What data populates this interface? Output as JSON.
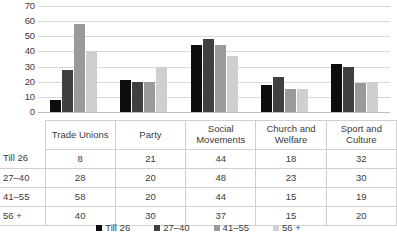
{
  "chart_data": {
    "type": "bar",
    "title": "",
    "xlabel": "",
    "ylabel": "",
    "ylim": [
      0,
      70
    ],
    "ytick_step": 10,
    "yticks": [
      70,
      60,
      50,
      40,
      30,
      20,
      10,
      0
    ],
    "grid": true,
    "legend_position": "bottom",
    "categories": [
      "Trade Unions",
      "Party",
      "Social Movements",
      "Church and Welfare",
      "Sport and Culture"
    ],
    "series": [
      {
        "name": "Till 26",
        "color": "#0d0d0d",
        "values": [
          8,
          21,
          44,
          18,
          32
        ]
      },
      {
        "name": "27–40",
        "color": "#404040",
        "values": [
          28,
          20,
          48,
          23,
          30
        ]
      },
      {
        "name": "41–55",
        "color": "#9a9a9a",
        "values": [
          58,
          20,
          44,
          15,
          19
        ]
      },
      {
        "name": "56 +",
        "color": "#cfcfcf",
        "values": [
          40,
          30,
          37,
          15,
          20
        ]
      }
    ]
  },
  "table": {
    "corner": "",
    "column_headers": [
      "Trade Unions",
      "Party",
      "Social Movements",
      "Church and Welfare",
      "Sport and Culture"
    ],
    "rows": [
      {
        "label": "Till 26",
        "values": [
          8,
          21,
          44,
          18,
          32
        ]
      },
      {
        "label": "27–40",
        "values": [
          28,
          20,
          48,
          23,
          30
        ]
      },
      {
        "label": "41–55",
        "values": [
          58,
          20,
          44,
          15,
          19
        ]
      },
      {
        "label": "56 +",
        "values": [
          40,
          30,
          37,
          15,
          20
        ]
      }
    ]
  },
  "legend": {
    "items": [
      {
        "label": "Till 26",
        "color": "#0d0d0d"
      },
      {
        "label": "27–40",
        "color": "#404040"
      },
      {
        "label": "41–55",
        "color": "#9a9a9a"
      },
      {
        "label": "56 +",
        "color": "#cfcfcf"
      }
    ]
  }
}
